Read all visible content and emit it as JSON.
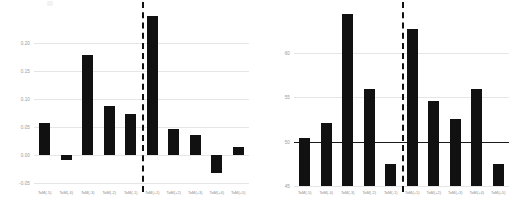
{
  "chart_data": [
    {
      "type": "bar",
      "panel": "left",
      "title": "",
      "xlabel": "",
      "ylabel": "",
      "categories": [
        "ToM(-5)",
        "ToM(-4)",
        "ToM(-3)",
        "ToM(-2)",
        "ToM(-1)",
        "ToM(+1)",
        "ToM(+2)",
        "ToM(+3)",
        "ToM(+4)",
        "ToM(+5)"
      ],
      "values": [
        0.058,
        -0.008,
        0.179,
        0.088,
        0.074,
        0.247,
        0.046,
        0.035,
        -0.031,
        0.014
      ],
      "yticks": [
        "0.20",
        "0.15",
        "0.10",
        "0.05",
        "0.00",
        "-0.05"
      ],
      "ytick_values": [
        0.2,
        0.15,
        0.1,
        0.05,
        0.0,
        -0.05
      ],
      "ylim": [
        -0.055,
        0.262
      ],
      "grid": true,
      "reference_line": null,
      "divider_after_index": 4,
      "divider_style": "dashed",
      "bar_color": "#111111",
      "grid_color": "#e6e6e6"
    },
    {
      "type": "bar",
      "panel": "right",
      "title": "",
      "xlabel": "",
      "ylabel": "",
      "categories": [
        "ToM(-5)",
        "ToM(-4)",
        "ToM(-3)",
        "ToM(-2)",
        "ToM(-1)",
        "ToM(+1)",
        "ToM(+2)",
        "ToM(+3)",
        "ToM(+4)",
        "ToM(+5)"
      ],
      "values": [
        50.4,
        52.1,
        64.3,
        55.9,
        47.5,
        62.6,
        54.5,
        52.5,
        55.9,
        47.5
      ],
      "yticks": [
        "60",
        "55",
        "50",
        "45"
      ],
      "ytick_values": [
        60,
        55,
        50,
        45
      ],
      "ylim": [
        45,
        65
      ],
      "grid": true,
      "reference_line": 50,
      "divider_after_index": 4,
      "divider_style": "dashed",
      "bar_color": "#111111",
      "grid_color": "#e6e6e6"
    }
  ]
}
